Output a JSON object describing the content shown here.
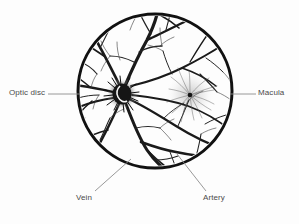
{
  "figure": {
    "name": "retinal-fundus-diagram",
    "background_color": "#fdfdfd",
    "ink_color": "#1a1a1a",
    "leader_color": "#8d8d8d",
    "text_color": "#4a4a4a",
    "circle": {
      "center_x": 155,
      "center_y": 91,
      "radius": 77,
      "stroke_width": 3
    }
  },
  "labels": [
    {
      "id": "optic-disc",
      "text": "Optic disc",
      "position": "left",
      "leader": {
        "x1": 48,
        "y1": 94,
        "x2": 80,
        "y2": 94
      }
    },
    {
      "id": "macula",
      "text": "Macula",
      "position": "right",
      "leader": {
        "x1": 230,
        "y1": 94,
        "x2": 256,
        "y2": 94
      }
    },
    {
      "id": "vein",
      "text": "Vein",
      "position": "bottom-left",
      "leader": {
        "x1": 131,
        "y1": 159,
        "x2": 95,
        "y2": 191
      }
    },
    {
      "id": "artery",
      "text": "Artery",
      "position": "bottom-right",
      "leader": {
        "x1": 177,
        "y1": 154,
        "x2": 206,
        "y2": 191
      }
    }
  ],
  "structures": {
    "optic_disc": {
      "center_x": 122,
      "center_y": 94,
      "radius": 11
    },
    "macula": {
      "center_x": 190,
      "center_y": 95,
      "radius": 16
    },
    "fovea": {
      "center_x": 190,
      "center_y": 95,
      "radius": 2.2
    }
  }
}
